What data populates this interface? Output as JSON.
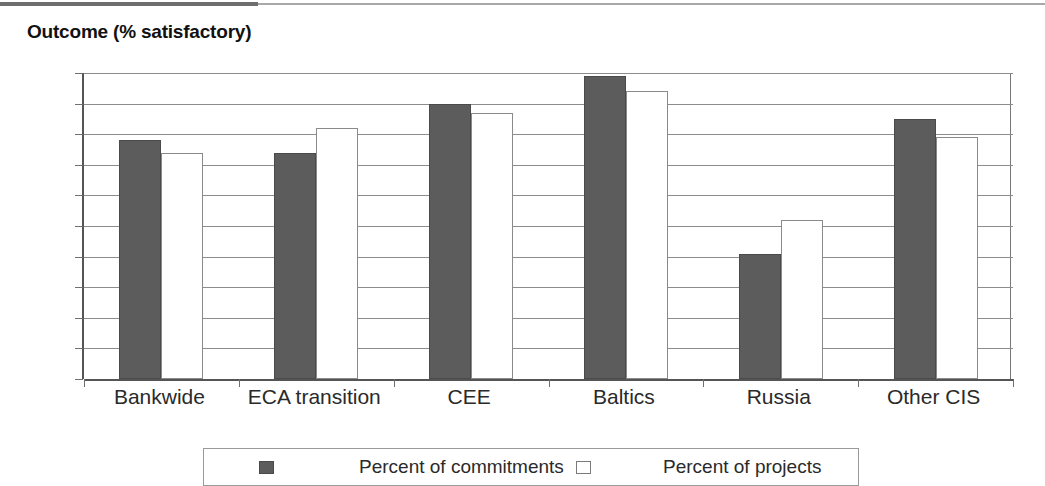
{
  "chart_data": {
    "type": "bar",
    "title": "Outcome (% satisfactory)",
    "xlabel": "",
    "ylabel": "",
    "ylim": [
      0,
      100
    ],
    "ytick_step": 10,
    "yticks": [
      100,
      90,
      80,
      70,
      60,
      50,
      40,
      30,
      20,
      10,
      0
    ],
    "grid": true,
    "grid_axis": "y",
    "legend_position": "bottom",
    "categories": [
      "Bankwide",
      "ECA transition",
      "CEE",
      "Baltics",
      "Russia",
      "Other CIS"
    ],
    "series": [
      {
        "name": "Percent of commitments",
        "color": "#5c5c5c",
        "values": [
          78,
          74,
          90,
          99,
          41,
          85
        ]
      },
      {
        "name": "Percent of projects",
        "color": "#ffffff",
        "values": [
          74,
          82,
          87,
          94,
          52,
          79
        ]
      }
    ]
  },
  "legend": {
    "entries": [
      {
        "label": "Percent of commitments",
        "swatch": "filled-dark-square-icon"
      },
      {
        "label": "Percent of projects",
        "swatch": "outlined-white-square-icon"
      }
    ]
  }
}
